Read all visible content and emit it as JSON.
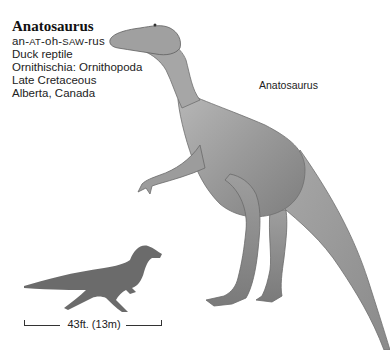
{
  "entry": {
    "title": "Anatosaurus",
    "pronunciation": {
      "parts": [
        "an-",
        "AT",
        "-oh-",
        "SAW",
        "-rus"
      ]
    },
    "meaning": "Duck reptile",
    "classification": "Ornithischia: Ornithopoda",
    "period": "Late Cretaceous",
    "location": "Alberta, Canada"
  },
  "illustration": {
    "label": "Anatosaurus",
    "description": "pencil-shaded illustration of a standing duck-billed dinosaur",
    "shade_color": "#8a8a8a"
  },
  "scale": {
    "silhouette_color": "#6b6b6b",
    "length_label": "43ft. (13m)"
  }
}
